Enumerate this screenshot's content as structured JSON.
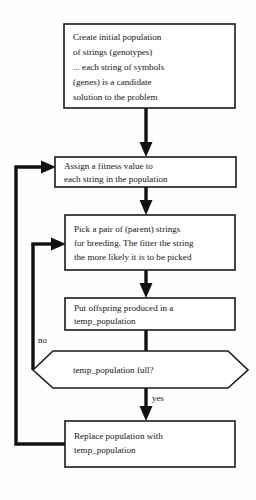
{
  "diagram": {
    "colors": {
      "stroke": "#111111",
      "node_fill": "#ffffff",
      "text": "#141414",
      "background": "#fefefe"
    },
    "nodes": [
      {
        "id": "create-initial-population",
        "shape": "rectangle",
        "lines": [
          "Create initial population",
          "of strings (genotypes)",
          "... each string of symbols",
          "(genes) is a candidate",
          "solution to the problem"
        ]
      },
      {
        "id": "assign-fitness-value",
        "shape": "rectangle",
        "lines": [
          "Assign a fitness value to",
          "each string in the population"
        ]
      },
      {
        "id": "pick-parent-strings",
        "shape": "rectangle",
        "lines": [
          "Pick a pair of (parent) strings",
          "for breeding. The fitter the string",
          "the more likely it is to be picked"
        ]
      },
      {
        "id": "put-offspring",
        "shape": "rectangle",
        "lines": [
          "Put offspring produced in a",
          "temp_population"
        ]
      },
      {
        "id": "temp-population-full",
        "shape": "hexagon",
        "lines": [
          "temp_population full?"
        ]
      },
      {
        "id": "replace-population",
        "shape": "rectangle",
        "lines": [
          "Replace population with",
          "temp_population"
        ]
      }
    ],
    "edge_labels": {
      "no": "no",
      "yes": "yes"
    }
  }
}
